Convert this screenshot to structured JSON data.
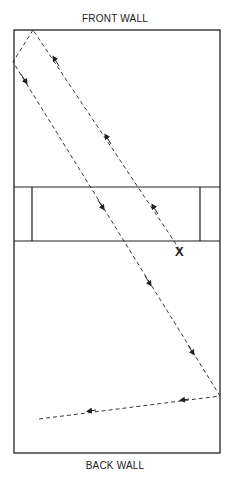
{
  "labels": {
    "front_wall": "FRONT WALL",
    "back_wall": "BACK WALL",
    "target_mark": "X"
  },
  "colors": {
    "line": "#222222",
    "background": "#ffffff"
  },
  "court": {
    "left": 14,
    "top": 30,
    "right": 220,
    "bottom": 453,
    "service_zone": {
      "top": 187,
      "bottom": 241,
      "box_left": 32,
      "box_right": 200
    }
  },
  "ball_paths": [
    {
      "name": "serve-path",
      "points": [
        [
          180,
          250
        ],
        [
          33,
          30
        ]
      ]
    },
    {
      "name": "return-path",
      "points": [
        [
          33,
          30
        ],
        [
          13,
          62
        ],
        [
          220,
          396
        ],
        [
          39,
          419
        ]
      ]
    }
  ]
}
